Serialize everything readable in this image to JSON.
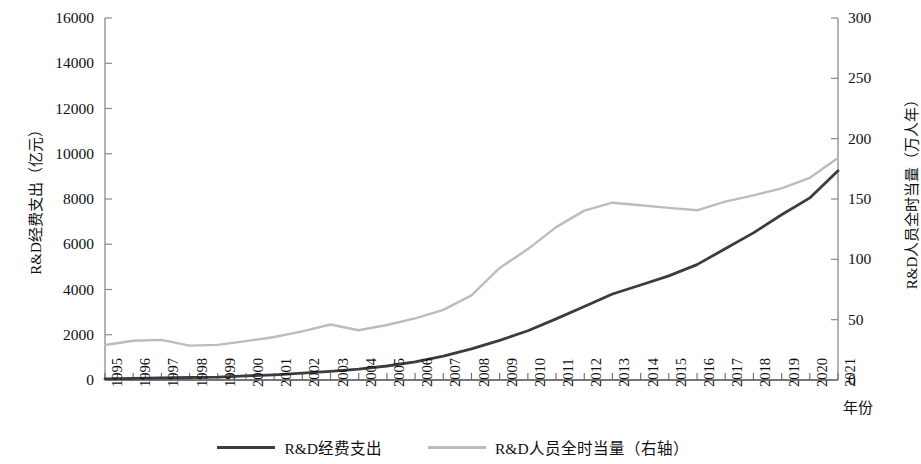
{
  "chart_data": {
    "type": "line",
    "title": "",
    "xlabel": "年份",
    "ylabel": "R&D经费支出（亿元）",
    "ylabel_right": "R&D人员全时当量（万人年）",
    "grid": false,
    "legend_position": "bottom",
    "ylim": [
      0,
      16000
    ],
    "ylim_right": [
      0,
      300
    ],
    "yticks": [
      "0",
      "2000",
      "4000",
      "6000",
      "8000",
      "10000",
      "12000",
      "14000",
      "16000"
    ],
    "yticks_right": [
      "0",
      "50",
      "100",
      "150",
      "200",
      "250",
      "300"
    ],
    "categories": [
      "1995",
      "1996",
      "1997",
      "1998",
      "1999",
      "2000",
      "2001",
      "2002",
      "2003",
      "2004",
      "2005",
      "2006",
      "2007",
      "2008",
      "2009",
      "2010",
      "2011",
      "2012",
      "2013",
      "2014",
      "2015",
      "2016",
      "2017",
      "2018",
      "2019",
      "2020",
      "2021"
    ],
    "series": [
      {
        "name": "R&D经费支出",
        "axis": "left",
        "color": "#3b3b43",
        "values": [
          349,
          404,
          509,
          551,
          679,
          896,
          1042,
          1288,
          1540,
          1966,
          2450,
          3003,
          3710,
          4616,
          5802,
          7063,
          8687,
          10298,
          11847,
          13016,
          14170,
          15677,
          17606,
          19678,
          22144,
          24393,
          27956
        ]
      },
      {
        "name": "R&D人员全时当量（右轴）",
        "axis": "right",
        "color": "#bcbcbc",
        "values": [
          29.0,
          32.6,
          33.2,
          28.5,
          29.1,
          32.2,
          35.6,
          40.3,
          46.0,
          41.2,
          45.6,
          51.1,
          58.1,
          70.1,
          92.9,
          108.5,
          126.7,
          140.4,
          146.9,
          144.8,
          142.6,
          140.6,
          147.8,
          153.0,
          158.8,
          167.6,
          184.1
        ]
      }
    ],
    "series_plot": [
      {
        "name": "R&D经费支出",
        "axis": "left",
        "values": [
          150,
          180,
          200,
          220,
          240,
          290,
          340,
          420,
          500,
          620,
          780,
          950,
          1180,
          1480,
          1850,
          2280,
          2820,
          3350,
          3900,
          4300,
          4700,
          5200,
          5900,
          6550,
          7350,
          8100,
          9300
        ]
      }
    ],
    "plot_left_values": [
      50,
      70,
      90,
      110,
      130,
      180,
      230,
      300,
      380,
      480,
      620,
      800,
      1050,
      1380,
      1750,
      2180,
      2700,
      3250,
      3800,
      4200,
      4600,
      5100,
      5800,
      6500,
      7300,
      8050,
      9250
    ]
  },
  "axes": {
    "left_title": "R&D经费支出（亿元）",
    "right_title": "R&D人员全时当量（万人年）",
    "x_title": "年份"
  },
  "legend": {
    "items": [
      {
        "label": "R&D经费支出",
        "style": "dark"
      },
      {
        "label": "R&D人员全时当量（右轴）",
        "style": "light"
      }
    ]
  }
}
